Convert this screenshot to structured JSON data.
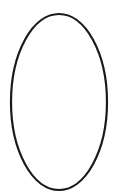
{
  "canvas": {
    "width": 113,
    "height": 196,
    "background": "#ffffff"
  },
  "shapes": [
    {
      "type": "ellipse",
      "cx": 59,
      "cy": 102,
      "rx": 48,
      "ry": 88,
      "fill": "#ffffff",
      "stroke": "#1a1a1a",
      "stroke_width": 2.2
    }
  ]
}
